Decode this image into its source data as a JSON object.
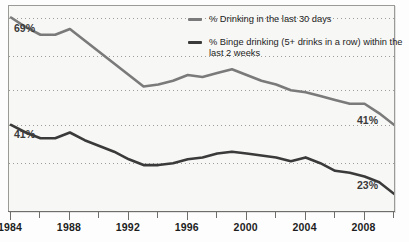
{
  "chart_data": {
    "type": "line",
    "title": "",
    "subtitle": "",
    "xlabel": "",
    "ylabel": "",
    "grid": true,
    "legend_position": "top-right",
    "xlim": [
      1984,
      2010
    ],
    "ylim": [
      18,
      72
    ],
    "x_tick_labels": [
      "1984",
      "1988",
      "1992",
      "1996",
      "2000",
      "2004",
      "2008"
    ],
    "x_tick_values": [
      1984,
      1988,
      1992,
      1996,
      2000,
      2004,
      2008
    ],
    "x_minor_tick_values": [
      1986,
      1990,
      1994,
      1998,
      2002,
      2006,
      2010
    ],
    "gridline_values": [
      69,
      59,
      50,
      41,
      31
    ],
    "annotations": [
      {
        "name": "start-top",
        "text": "69%",
        "series": "drinking-30-days",
        "x": 1984,
        "y": 69
      },
      {
        "name": "start-bottom",
        "text": "41%",
        "series": "binge-drinking",
        "x": 1984,
        "y": 41
      },
      {
        "name": "end-top",
        "text": "41%",
        "series": "drinking-30-days",
        "x": 2010,
        "y": 41
      },
      {
        "name": "end-bottom",
        "text": "23%",
        "series": "binge-drinking",
        "x": 2010,
        "y": 23
      }
    ],
    "x": [
      1984,
      1985,
      1986,
      1987,
      1988,
      1989,
      1990,
      1991,
      1992,
      1993,
      1994,
      1995,
      1996,
      1997,
      1998,
      1999,
      2000,
      2001,
      2002,
      2003,
      2004,
      2005,
      2006,
      2007,
      2008,
      2009,
      2010
    ],
    "series": [
      {
        "name": "% Drinking in the last 30 days",
        "color": "#7a7a7a",
        "values": [
          69,
          66.5,
          64.5,
          64.5,
          66,
          63,
          60,
          57,
          54,
          51,
          51.5,
          52.5,
          54,
          53.5,
          54.5,
          55.5,
          54,
          52.5,
          51.5,
          50,
          49.5,
          48.5,
          47.5,
          46.5,
          46.5,
          44,
          41
        ]
      },
      {
        "name": "% Binge drinking (5+ drinks in a row) within the last 2 weeks",
        "color": "#3a3a3a",
        "values": [
          41,
          39,
          37.5,
          37.5,
          39,
          37,
          35.5,
          34,
          32,
          30.5,
          30.5,
          31,
          32,
          32.5,
          33.5,
          34,
          33.5,
          33,
          32.5,
          31.5,
          32.5,
          31,
          29,
          28.5,
          27.5,
          26,
          23
        ]
      }
    ]
  },
  "legend": {
    "items": [
      {
        "label": "% Drinking in the last 30 days",
        "color": "#7a7a7a"
      },
      {
        "label": "% Binge drinking (5+ drinks in a row) within the last 2 weeks",
        "color": "#3a3a3a"
      }
    ]
  },
  "axis": {
    "labels": [
      "1984",
      "1988",
      "1992",
      "1996",
      "2000",
      "2004",
      "2008"
    ]
  },
  "value_labels": {
    "start_top": "69%",
    "start_bottom": "41%",
    "end_top": "41%",
    "end_bottom": "23%"
  }
}
